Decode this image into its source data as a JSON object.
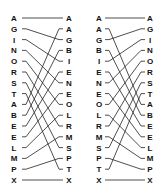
{
  "diagrams": [
    {
      "name": "merge-left",
      "left_column": [
        "A",
        "G",
        "I",
        "N",
        "O",
        "R",
        "S",
        "T",
        "A",
        "B",
        "E",
        "E",
        "L",
        "M",
        "P",
        "X"
      ],
      "right_column": [
        "A",
        "A",
        "G",
        "B",
        "I",
        "E",
        "N",
        "E",
        "O",
        "L",
        "R",
        "M",
        "S",
        "P",
        "T",
        "X"
      ],
      "connections": [
        [
          0,
          0
        ],
        [
          1,
          2
        ],
        [
          2,
          4
        ],
        [
          3,
          6
        ],
        [
          4,
          8
        ],
        [
          5,
          10
        ],
        [
          6,
          12
        ],
        [
          7,
          14
        ],
        [
          8,
          1
        ],
        [
          9,
          3
        ],
        [
          10,
          5
        ],
        [
          11,
          7
        ],
        [
          12,
          9
        ],
        [
          13,
          11
        ],
        [
          14,
          13
        ],
        [
          15,
          15
        ]
      ],
      "layout": {
        "left_label_x": 14,
        "line_start_x": 22,
        "line_end_x": 63,
        "right_label_x": 69
      }
    },
    {
      "name": "merge-right",
      "left_column": [
        "A",
        "A",
        "G",
        "B",
        "I",
        "E",
        "N",
        "E",
        "O",
        "L",
        "R",
        "M",
        "S",
        "P",
        "T",
        "X"
      ],
      "right_column": [
        "A",
        "G",
        "I",
        "N",
        "O",
        "R",
        "S",
        "T",
        "A",
        "B",
        "E",
        "E",
        "L",
        "M",
        "P",
        "X"
      ],
      "connections": [
        [
          0,
          0
        ],
        [
          2,
          1
        ],
        [
          4,
          2
        ],
        [
          6,
          3
        ],
        [
          8,
          4
        ],
        [
          10,
          5
        ],
        [
          12,
          6
        ],
        [
          14,
          7
        ],
        [
          1,
          8
        ],
        [
          3,
          9
        ],
        [
          5,
          10
        ],
        [
          7,
          11
        ],
        [
          9,
          12
        ],
        [
          11,
          13
        ],
        [
          13,
          14
        ],
        [
          15,
          15
        ]
      ],
      "layout": {
        "left_label_x": 99,
        "line_start_x": 105,
        "line_end_x": 145,
        "right_label_x": 150
      }
    }
  ],
  "rows": {
    "first_y": 18,
    "last_y": 180,
    "count": 16
  }
}
